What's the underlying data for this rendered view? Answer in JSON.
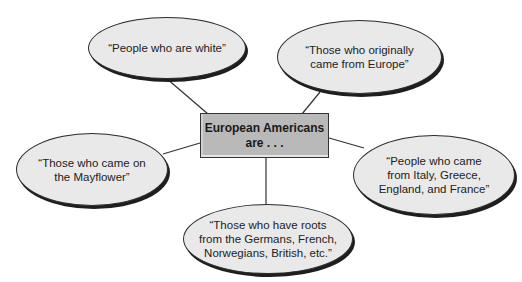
{
  "center": {
    "line1": "European Americans",
    "line2": "are . . ."
  },
  "bubbles": [
    {
      "id": "top-left",
      "lines": [
        "“People who are white”"
      ]
    },
    {
      "id": "top-right",
      "lines": [
        "“Those who originally",
        "came from Europe”"
      ]
    },
    {
      "id": "left",
      "lines": [
        "“Those who came on",
        "the Mayflower”"
      ]
    },
    {
      "id": "right",
      "lines": [
        "“People who came",
        "from Italy, Greece,",
        "England, and France”"
      ]
    },
    {
      "id": "bottom",
      "lines": [
        "“Those who have roots",
        "from the Germans, French,",
        "Norwegians, British, etc.”"
      ]
    }
  ],
  "colors": {
    "bubble_fill": "#e9e9e9",
    "box_fill": "#b9b9b9",
    "stroke": "#2a2a2a"
  }
}
